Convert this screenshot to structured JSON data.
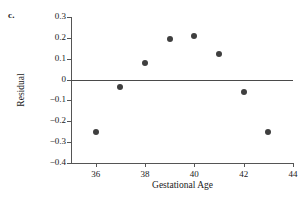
{
  "panel": {
    "letter": "c."
  },
  "chart_data": {
    "type": "scatter",
    "title": "",
    "xlabel": "Gestational Age",
    "ylabel": "Residual",
    "xlim": [
      35,
      44
    ],
    "ylim": [
      -0.4,
      0.3
    ],
    "grid": false,
    "legend": null,
    "x_ticks": [
      36,
      38,
      40,
      42,
      44
    ],
    "x_tick_labels": [
      "36",
      "38",
      "40",
      "42",
      "44"
    ],
    "y_ticks": [
      0.3,
      0.2,
      0.1,
      0,
      -0.1,
      -0.2,
      -0.3,
      -0.4
    ],
    "y_tick_labels": [
      "0.3",
      "0.2",
      "0.1",
      "0",
      "−0.1",
      "−0.2",
      "−0.3",
      "−0.4"
    ],
    "reference_line": {
      "y": 0,
      "color": "#4a4a4a"
    },
    "marker_color": "#3f3f3f",
    "x": [
      36,
      37,
      38,
      39,
      40,
      41,
      42,
      43
    ],
    "y": [
      -0.25,
      -0.035,
      0.08,
      0.195,
      0.21,
      0.125,
      -0.06,
      -0.25
    ],
    "points": [
      {
        "x": 36,
        "y": -0.25
      },
      {
        "x": 37,
        "y": -0.035
      },
      {
        "x": 38,
        "y": 0.08
      },
      {
        "x": 39,
        "y": 0.195
      },
      {
        "x": 40,
        "y": 0.21
      },
      {
        "x": 41,
        "y": 0.125
      },
      {
        "x": 42,
        "y": -0.06
      },
      {
        "x": 43,
        "y": -0.25
      }
    ]
  }
}
